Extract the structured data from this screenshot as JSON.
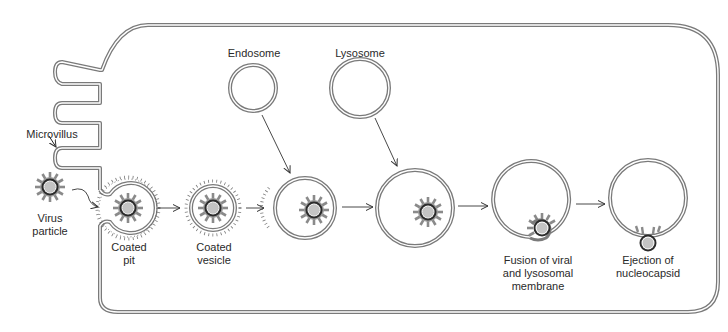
{
  "diagram": {
    "colors": {
      "membrane": "#7a7a7a",
      "membrane_inner": "#ffffff",
      "spike": "#8a8a8a",
      "capsid_dark": "#2b2b2b",
      "nucleoid": "#c8c8c8",
      "text": "#2a2a2a"
    },
    "labels": {
      "endosome": "Endosome",
      "lysosome": "Lysosome",
      "microvillus": "Microvillus",
      "virus_particle_line1": "Virus",
      "virus_particle_line2": "particle",
      "coated_pit_line1": "Coated",
      "coated_pit_line2": "pit",
      "coated_vesicle_line1": "Coated",
      "coated_vesicle_line2": "vesicle",
      "fusion_line1": "Fusion of viral",
      "fusion_line2": "and lysosomal",
      "fusion_line3": "membrane",
      "ejection_line1": "Ejection of",
      "ejection_line2": "nucleocapsid"
    },
    "stages": [
      {
        "name": "virus-particle"
      },
      {
        "name": "coated-pit"
      },
      {
        "name": "coated-vesicle"
      },
      {
        "name": "endosome-fusion"
      },
      {
        "name": "lysosome-fusion"
      },
      {
        "name": "membrane-fusion"
      },
      {
        "name": "nucleocapsid-ejection"
      }
    ]
  }
}
